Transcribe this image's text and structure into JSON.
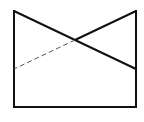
{
  "diagram": {
    "type": "geometric-figure",
    "width": 144,
    "height": 122,
    "background": "#ffffff",
    "stroke_color": "#111111",
    "dash_color": "#555555",
    "vertices": {
      "top_left": [
        14,
        11
      ],
      "top_right": [
        136,
        11
      ],
      "bottom_left": [
        14,
        107
      ],
      "bottom_right": [
        136,
        107
      ],
      "left_mid": [
        14,
        69
      ],
      "right_mid": [
        136,
        69
      ],
      "intersection": [
        75,
        40
      ]
    },
    "segments": [
      {
        "name": "left-edge",
        "from": [
          14,
          11
        ],
        "to": [
          14,
          107
        ],
        "style": "solid"
      },
      {
        "name": "bottom-edge",
        "from": [
          14,
          107
        ],
        "to": [
          136,
          107
        ],
        "style": "solid"
      },
      {
        "name": "right-edge",
        "from": [
          136,
          11
        ],
        "to": [
          136,
          107
        ],
        "style": "solid"
      },
      {
        "name": "diagonal-top-left-to-right-mid",
        "from": [
          14,
          11
        ],
        "to": [
          136,
          69
        ],
        "style": "solid"
      },
      {
        "name": "diagonal-top-right-to-intersection",
        "from": [
          136,
          11
        ],
        "to": [
          75,
          40
        ],
        "style": "solid"
      },
      {
        "name": "hidden-line-intersection-to-left-mid",
        "from": [
          75,
          40
        ],
        "to": [
          14,
          69
        ],
        "style": "dashed"
      }
    ]
  }
}
